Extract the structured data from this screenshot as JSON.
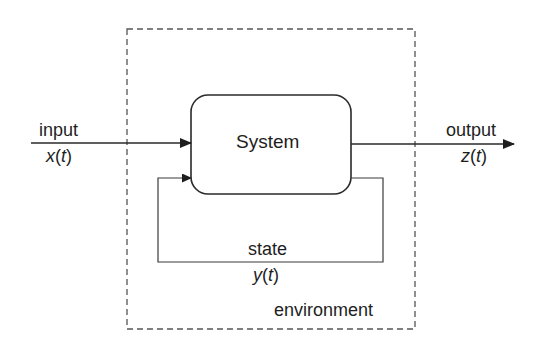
{
  "diagram": {
    "type": "block-diagram",
    "environment": {
      "label": "environment",
      "border": "dashed"
    },
    "system": {
      "label": "System"
    },
    "input": {
      "label": "input",
      "signal_fn": "x",
      "signal_open": "(",
      "signal_var": "t",
      "signal_close": ")"
    },
    "output": {
      "label": "output",
      "signal_fn": "z",
      "signal_open": "(",
      "signal_var": "t",
      "signal_close": ")"
    },
    "state": {
      "label": "state",
      "signal_fn": "y",
      "signal_open": "(",
      "signal_var": "t",
      "signal_close": ")"
    },
    "colors": {
      "line": "#2a2a2a",
      "dashed": "#555555",
      "background": "#ffffff"
    }
  }
}
